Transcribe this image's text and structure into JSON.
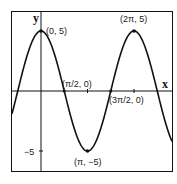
{
  "chart_data": {
    "type": "line",
    "title": "",
    "function": "y = 5 cos x",
    "xlabel": "x",
    "ylabel": "y",
    "x_range": [
      -0.62,
      2.85
    ],
    "y_range": [
      -6.7,
      6.6
    ],
    "grid": false,
    "series": [
      {
        "name": "y = 5cos(x)",
        "points": [
          {
            "x": 0,
            "y": 5,
            "label": "(0, 5)"
          },
          {
            "x": 1.5708,
            "y": 0,
            "label": "(π/2, 0)"
          },
          {
            "x": 3.1416,
            "y": -5,
            "label": "(π, −5)"
          },
          {
            "x": 4.7124,
            "y": 0,
            "label": "(3π/2, 0)"
          },
          {
            "x": 6.2832,
            "y": 5,
            "label": "(2π, 5)"
          }
        ]
      }
    ],
    "y_ticks": [
      {
        "value": -5,
        "label": "−5"
      }
    ],
    "x_ticks": [
      {
        "value": 3.1416,
        "label": ""
      },
      {
        "value": 6.2832,
        "label": ""
      }
    ],
    "annotations": [
      "(0, 5)",
      "(π/2, 0)",
      "(π, −5)",
      "(3π/2, 0)",
      "(2π, 5)"
    ]
  },
  "labels": {
    "x_axis": "x",
    "y_axis": "y",
    "y_tick_neg5": "−5",
    "pt_0_5": "(0, 5)",
    "pt_2pi_5": "(2π, 5)",
    "pt_pi_neg5": "(π, −5)",
    "pt_pi2_0": "(π/2, 0)",
    "pt_3pi2_0": "(3π/2, 0)"
  },
  "geometry": {
    "origin_px": [
      41,
      91
    ],
    "px_per_pi": 46.5,
    "px_per_unit_y": 12
  },
  "colors": {
    "stroke": "#111111",
    "background": "#ffffff"
  }
}
